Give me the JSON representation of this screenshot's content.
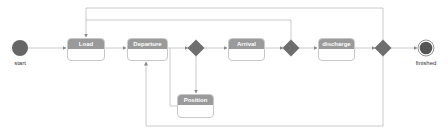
{
  "diagram": {
    "type": "uml-activity-diagram",
    "colors": {
      "line": "#bdbdbd",
      "state_header": "#9a9a9a",
      "state_border": "#c8c8c8",
      "node_fill": "#666666",
      "decision_fill": "#6e6e6e",
      "label_text": "#333333"
    },
    "start": {
      "label": "start"
    },
    "end": {
      "label": "finished"
    },
    "states": {
      "load": {
        "label": "Load"
      },
      "departure": {
        "label": "Departure"
      },
      "arrival": {
        "label": "Arrival"
      },
      "discharge": {
        "label": "discharge"
      },
      "position": {
        "label": "Position"
      }
    },
    "decisions": [
      "decision-1",
      "decision-2",
      "decision-3"
    ],
    "transitions": [
      {
        "from": "start",
        "to": "Load"
      },
      {
        "from": "Load",
        "to": "Departure"
      },
      {
        "from": "Departure",
        "to": "decision-1"
      },
      {
        "from": "Departure",
        "to": "Position"
      },
      {
        "from": "decision-1",
        "to": "Arrival"
      },
      {
        "from": "decision-1",
        "to": "Position"
      },
      {
        "from": "Arrival",
        "to": "decision-2"
      },
      {
        "from": "decision-2",
        "to": "discharge"
      },
      {
        "from": "decision-2",
        "to": "Load"
      },
      {
        "from": "discharge",
        "to": "decision-3"
      },
      {
        "from": "decision-3",
        "to": "finished"
      },
      {
        "from": "decision-3",
        "to": "Load"
      },
      {
        "from": "decision-3",
        "to": "Departure"
      }
    ]
  }
}
